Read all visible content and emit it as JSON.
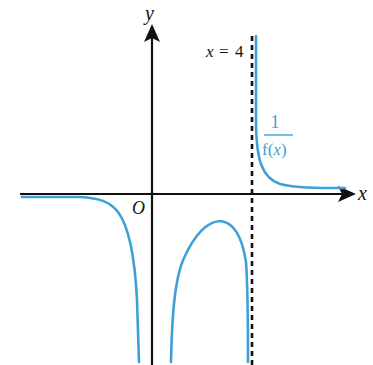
{
  "diagram": {
    "type": "function-graph",
    "axes": {
      "x_label": "x",
      "y_label": "y",
      "origin_label": "O"
    },
    "asymptote": {
      "label": "x = 4",
      "label_x": "x",
      "label_eq": "=",
      "label_value": "4",
      "style": "dashed"
    },
    "curve": {
      "label_numerator": "1",
      "label_denominator": "f(x)",
      "label_denominator_f": "f(",
      "label_denominator_x": "x",
      "label_denominator_close": ")",
      "color": "#3fa0d8"
    },
    "colors": {
      "axis": "#111111",
      "curve": "#3fa0d8",
      "asymptote": "#111111"
    }
  }
}
